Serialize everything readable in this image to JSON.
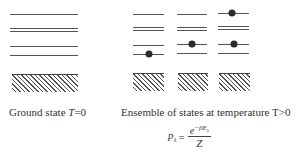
{
  "ground_state": {
    "label_prefix": "Ground state ",
    "label_var": "T",
    "label_suffix": "=0",
    "levels_y": [
      14,
      28,
      31,
      46,
      55
    ],
    "x": [
      10,
      78
    ],
    "occupied": []
  },
  "ensemble": {
    "label": "Ensemble of states at temperature T>0",
    "columns": [
      {
        "x": [
          133,
          164
        ],
        "levels_y": [
          14,
          27,
          30,
          45,
          54
        ],
        "dots": [
          {
            "x": 149,
            "y": 54
          }
        ]
      },
      {
        "x": [
          177,
          207
        ],
        "levels_y": [
          14,
          27,
          30,
          44,
          53
        ],
        "dots": [
          {
            "x": 192,
            "y": 44
          }
        ]
      },
      {
        "x": [
          218,
          249
        ],
        "levels_y": [
          13,
          26,
          29,
          44,
          53
        ],
        "dots": [
          {
            "x": 232,
            "y": 13
          },
          {
            "x": 234,
            "y": 44
          }
        ]
      }
    ]
  },
  "formula": {
    "lhs": "p",
    "lhs_sub": "λ",
    "equals": "=",
    "numerator_base": "e",
    "numerator_exp": "−βE",
    "numerator_exp_sub": "λ",
    "denominator": "Z"
  }
}
